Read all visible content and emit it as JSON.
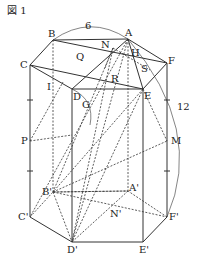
{
  "figure": {
    "title": "図 1",
    "labels": {
      "A": "A",
      "B": "B",
      "C": "C",
      "D": "D",
      "E": "E",
      "F": "F",
      "N": "N",
      "H": "H",
      "Q": "Q",
      "S": "S",
      "R": "R",
      "I": "I",
      "G": "G",
      "P": "P",
      "M": "M",
      "A2": "A'",
      "B2": "B'",
      "C2": "C'",
      "D2": "D'",
      "E2": "E'",
      "F2": "F'",
      "N2": "N'"
    },
    "dims": {
      "top": "6",
      "right": "12"
    }
  }
}
